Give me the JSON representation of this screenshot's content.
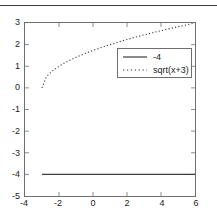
{
  "figure": {
    "header_rule": "horizontal-rule",
    "background_color": "#ffffff",
    "axis_color": "#6e6e6e",
    "text_color": "#1a1a1a"
  },
  "legend": {
    "position": "top-right-inside",
    "entries": [
      {
        "label": "-4",
        "style": "solid",
        "color": "#3c3c3c",
        "sample": "solid-line-sample"
      },
      {
        "label": "sqrt(x+3)",
        "style": "dotted",
        "color": "#3c3c3c",
        "sample": "dotted-line-sample"
      }
    ]
  },
  "chart_data": {
    "type": "line",
    "title": "",
    "subtitle": "",
    "xlabel": "",
    "ylabel": "",
    "xlim": [
      -4,
      6
    ],
    "ylim": [
      -5,
      3
    ],
    "grid": false,
    "legend_position": "upper right",
    "xticks": [
      -4,
      -2,
      0,
      2,
      4,
      6
    ],
    "xticklabels": [
      "-4",
      "-2",
      "0",
      "2",
      "4",
      "6"
    ],
    "yticks": [
      -5,
      -4,
      -3,
      -2,
      -1,
      0,
      1,
      2,
      3
    ],
    "yticklabels": [
      "-5",
      "-4",
      "-3",
      "-2",
      "-1",
      "0",
      "1",
      "2",
      "3"
    ],
    "series": [
      {
        "name": "-4",
        "style": "solid",
        "color": "#3c3c3c",
        "x": [
          -3,
          -2,
          -1,
          0,
          1,
          2,
          3,
          4,
          5,
          6
        ],
        "values": [
          -4,
          -4,
          -4,
          -4,
          -4,
          -4,
          -4,
          -4,
          -4,
          -4
        ]
      },
      {
        "name": "sqrt(x+3)",
        "style": "dotted",
        "color": "#3c3c3c",
        "x": [
          -3,
          -2.75,
          -2.5,
          -2.25,
          -2,
          -1.75,
          -1.5,
          -1.25,
          -1,
          -0.5,
          0,
          0.5,
          1,
          1.5,
          2,
          2.5,
          3,
          3.5,
          4,
          4.5,
          5,
          5.5,
          6
        ],
        "values": [
          0,
          0.5,
          0.707,
          0.866,
          1,
          1.118,
          1.225,
          1.323,
          1.414,
          1.581,
          1.732,
          1.871,
          2,
          2.121,
          2.236,
          2.345,
          2.449,
          2.55,
          2.646,
          2.739,
          2.828,
          2.915,
          3
        ]
      }
    ]
  }
}
